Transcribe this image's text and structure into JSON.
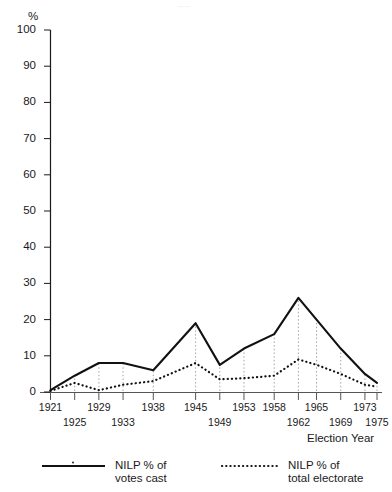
{
  "figure": {
    "y_axis_unit_label": "%",
    "x_axis_title": "Election Year",
    "top_artifact": "~~~"
  },
  "chart_data": {
    "type": "line",
    "title": "",
    "subtitle": "",
    "xlabel": "Election Year",
    "ylabel": "%",
    "ylim": [
      0,
      100
    ],
    "ytick_labels": [
      "0",
      "10",
      "20",
      "30",
      "40",
      "50",
      "60",
      "70",
      "80",
      "90",
      "100"
    ],
    "yticks": [
      0,
      10,
      20,
      30,
      40,
      50,
      60,
      70,
      80,
      90,
      100
    ],
    "grid": "vertical dotted droplines at each election year",
    "legend_position": "below-plot",
    "categories": [
      "1921",
      "1925",
      "1929",
      "1933",
      "1938",
      "1945",
      "1949",
      "1953",
      "1958",
      "1962",
      "1965",
      "1969",
      "1973",
      "1975"
    ],
    "x": [
      1921,
      1925,
      1929,
      1933,
      1938,
      1945,
      1949,
      1953,
      1958,
      1962,
      1965,
      1969,
      1973,
      1975
    ],
    "series": [
      {
        "name": "NILP % of votes cast",
        "style": "solid",
        "color": "#111111",
        "values": [
          0.5,
          4.5,
          8.0,
          8.0,
          6.0,
          19.0,
          7.5,
          12.0,
          16.0,
          26.0,
          20.0,
          12.0,
          5.0,
          2.5
        ]
      },
      {
        "name": "NILP % of total electorate",
        "style": "dotted",
        "color": "#111111",
        "values": [
          0.3,
          2.5,
          0.5,
          2.0,
          3.0,
          8.0,
          3.5,
          3.8,
          4.5,
          9.0,
          7.5,
          5.0,
          2.0,
          1.5
        ]
      }
    ]
  },
  "xtick_rows": {
    "upper": [
      "1921",
      "1929",
      "1938",
      "1945",
      "1953",
      "1958",
      "1965",
      "1973"
    ],
    "lower": [
      "1925",
      "1933",
      "1949",
      "1962",
      "1969",
      "1975"
    ]
  },
  "legend": {
    "items": [
      {
        "key": "solid-line-swatch",
        "label": "NILP % of\nvotes cast"
      },
      {
        "key": "dotted-line-swatch",
        "label": "NILP % of\ntotal electorate"
      }
    ]
  }
}
